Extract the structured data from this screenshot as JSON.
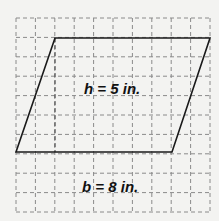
{
  "diagram": {
    "shape": "parallelogram",
    "grid": {
      "cols": 10,
      "rows": 10,
      "origin_x": 16,
      "origin_y": 18,
      "cell": 19.4,
      "line_color": "#8a8a8a",
      "style": "dashed"
    },
    "vertices": {
      "top_left": [
        55,
        38
      ],
      "top_right": [
        210,
        38
      ],
      "bottom_right": [
        172,
        152
      ],
      "bottom_left": [
        16,
        152
      ]
    },
    "height_line_x": 55,
    "labels": {
      "height": "h = 5 in.",
      "base": "b = 8 in."
    },
    "stroke_color": "#1a1a1a"
  }
}
